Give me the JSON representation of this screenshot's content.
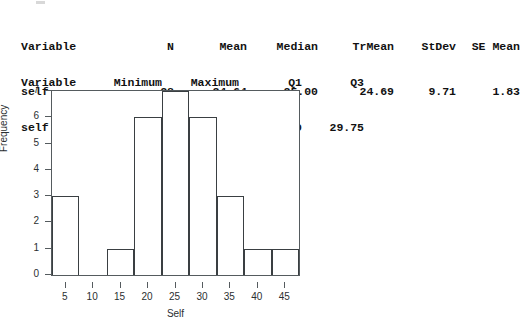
{
  "stats_output": {
    "block1": {
      "headers": [
        "Variable",
        "N",
        "Mean",
        "Median",
        "TrMean",
        "StDev",
        "SE Mean"
      ],
      "row": [
        "self",
        "28",
        "24.64",
        "25.00",
        "24.69",
        "9.71",
        "1.83"
      ]
    },
    "block2": {
      "headers": [
        "Variable",
        "Minimum",
        "Maximum",
        "Q1",
        "Q3"
      ],
      "row": [
        "self",
        "3.00",
        "45.00",
        "20.00",
        "29.75"
      ]
    }
  },
  "chart_data": {
    "type": "bar",
    "title": "",
    "xlabel": "Self",
    "ylabel": "Frequency",
    "xlim": [
      2.5,
      47.5
    ],
    "ylim": [
      0,
      7
    ],
    "grid": false,
    "legend": false,
    "x_ticks": [
      "5",
      "10",
      "15",
      "20",
      "25",
      "30",
      "35",
      "40",
      "45"
    ],
    "x_tick_values": [
      5,
      10,
      15,
      20,
      25,
      30,
      35,
      40,
      45
    ],
    "y_ticks": [
      "0",
      "1",
      "2",
      "3",
      "4",
      "5",
      "6",
      "7"
    ],
    "y_tick_values": [
      0,
      1,
      2,
      3,
      4,
      5,
      6,
      7
    ],
    "bin_width": 5,
    "bin_edges": [
      2.5,
      7.5,
      12.5,
      17.5,
      22.5,
      27.5,
      32.5,
      37.5,
      42.5,
      47.5
    ],
    "categories": [
      "2.5-7.5",
      "7.5-12.5",
      "12.5-17.5",
      "17.5-22.5",
      "22.5-27.5",
      "27.5-32.5",
      "32.5-37.5",
      "37.5-42.5",
      "42.5-47.5"
    ],
    "values": [
      3,
      0,
      1,
      6,
      7,
      6,
      3,
      1,
      1
    ],
    "total_count": 28,
    "colors": {
      "bar_outline": "#3a3f42",
      "bar_fill": "transparent",
      "axis": "#555b5e",
      "background": "#ffffff"
    }
  }
}
